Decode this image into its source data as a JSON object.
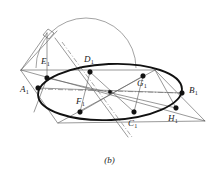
{
  "figure": {
    "caption": "(b)",
    "kind": "solid-geometry-diagram",
    "colors": {
      "ellipse_stroke": "#111111",
      "thin_stroke": "#5a5a5a",
      "arc_stroke": "#6a6a6a",
      "dash_stroke": "#6a6a6a",
      "point_fill": "#111111",
      "background": "#ffffff",
      "label_text": "#1a1a1a"
    }
  },
  "points": [
    {
      "id": "A1",
      "letter": "A",
      "subscript": "1",
      "label": "A₁",
      "x": 38,
      "y": 88,
      "label_x": 20,
      "label_y": 85,
      "on": "ellipse"
    },
    {
      "id": "B1",
      "letter": "B",
      "subscript": "1",
      "label": "B₁",
      "x": 182,
      "y": 93,
      "label_x": 189,
      "label_y": 87,
      "on": "ellipse"
    },
    {
      "id": "C1",
      "letter": "C",
      "subscript": "1",
      "label": "C₁",
      "x": 134,
      "y": 112,
      "label_x": 128,
      "label_y": 119,
      "on": "ellipse"
    },
    {
      "id": "D1",
      "letter": "D",
      "subscript": "1",
      "label": "D₁",
      "x": 90,
      "y": 72,
      "label_x": 84,
      "label_y": 56,
      "on": "ellipse"
    },
    {
      "id": "E1",
      "letter": "E",
      "subscript": "1",
      "label": "E₁",
      "x": 47,
      "y": 78,
      "label_x": 41,
      "label_y": 58,
      "on": "ellipse"
    },
    {
      "id": "F1",
      "letter": "F",
      "subscript": "1",
      "label": "F₁",
      "x": 80,
      "y": 112,
      "label_x": 76,
      "label_y": 97,
      "on": "ellipse"
    },
    {
      "id": "G1",
      "letter": "G",
      "subscript": "1",
      "label": "G₁",
      "x": 143,
      "y": 76,
      "label_x": 136,
      "label_y": 80,
      "on": "ellipse"
    },
    {
      "id": "H1",
      "letter": "H",
      "subscript": "1",
      "label": "H₁",
      "x": 176,
      "y": 108,
      "label_x": 169,
      "label_y": 114,
      "on": "ellipse"
    }
  ],
  "ellipse": {
    "center_x": 110,
    "center_y": 92,
    "radius_x": 72,
    "radius_y": 28,
    "rotation_deg": -2.5
  },
  "arc": {
    "center_x": 86,
    "center_y": 68,
    "radius": 50,
    "start_deg": 180,
    "end_deg": 0
  },
  "plane": {
    "vertices": [
      {
        "name": "left",
        "x": 21,
        "y": 70
      },
      {
        "name": "top",
        "x": 155,
        "y": 70
      },
      {
        "name": "right",
        "x": 205,
        "y": 121
      },
      {
        "name": "bottom",
        "x": 58,
        "y": 123
      }
    ]
  },
  "right_angle_marker": {
    "x": 47,
    "y": 33,
    "size": 7
  },
  "center_point": {
    "x": 110,
    "y": 92
  }
}
